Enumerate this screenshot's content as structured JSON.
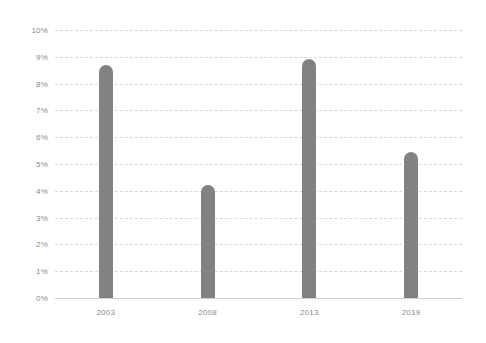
{
  "chart_data": {
    "type": "bar",
    "title": "",
    "subtitle": "",
    "xlabel": "",
    "ylabel": "",
    "categories": [
      "2003",
      "2008",
      "2013",
      "2019"
    ],
    "values": [
      8.7,
      4.2,
      8.9,
      5.45
    ],
    "series": [
      {
        "name": "",
        "values": [
          8.7,
          4.2,
          8.9,
          5.45
        ]
      }
    ],
    "ylim": [
      0,
      10
    ],
    "y_tick_labels": [
      "0%",
      "1%",
      "2%",
      "3%",
      "4%",
      "5%",
      "6%",
      "7%",
      "8%",
      "9%",
      "10%"
    ],
    "y_tick_values": [
      0,
      1,
      2,
      3,
      4,
      5,
      6,
      7,
      8,
      9,
      10
    ],
    "grid": true,
    "grid_style": "dashed-horizontal",
    "legend": false,
    "legend_position": "none",
    "annotations": [],
    "colors": {
      "bar": "#828282",
      "gridline": "#d8d8d8",
      "baseline": "#cfcfcf",
      "tick_label": "#8a8a8a",
      "background": "#ffffff"
    }
  }
}
